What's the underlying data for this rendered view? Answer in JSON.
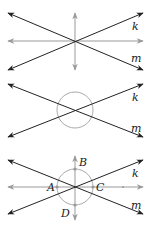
{
  "panels": [
    {
      "id": "panel-1",
      "description": "Lines k and m intersecting with horizontal and vertical gray reference lines",
      "line_labels": {
        "k": "k",
        "m": "m"
      }
    },
    {
      "id": "panel-2",
      "description": "Lines k and m intersecting with a circle centered at the intersection",
      "line_labels": {
        "k": "k",
        "m": "m"
      }
    },
    {
      "id": "panel-3",
      "description": "Lines k and m with circle and points A, B, C, D on gray axes",
      "line_labels": {
        "k": "k",
        "m": "m"
      },
      "point_labels": {
        "A": "A",
        "B": "B",
        "C": "C",
        "D": "D"
      }
    }
  ],
  "colors": {
    "line": "#222222",
    "gray": "#999999",
    "circle": "#aaaaaa"
  }
}
